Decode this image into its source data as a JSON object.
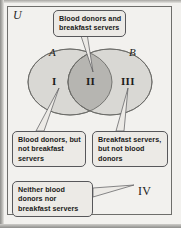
{
  "figure": {
    "universal_set_label": "U",
    "set_labels": {
      "left": "A",
      "right": "B"
    },
    "region_numerals": {
      "one": "I",
      "two": "II",
      "three": "III",
      "four": "IV"
    },
    "colors": {
      "page_background": "#f2f1ee",
      "circle_fill": "#d9d8d4",
      "intersection_fill": "#b6b5b1",
      "circle_stroke": "#6b6b68",
      "callout_fill": "#eceae6",
      "callout_stroke": "#57575a",
      "text": "#1b1b19"
    }
  },
  "callouts": {
    "intersection": {
      "name": "blood-donors-and-breakfast-servers",
      "lines": [
        "Blood donors and",
        "breakfast servers"
      ],
      "points_to": "II"
    },
    "left_only": {
      "name": "blood-donors-not-breakfast-servers",
      "lines": [
        "Blood donors, but",
        "not breakfast",
        "servers"
      ],
      "points_to": "I"
    },
    "right_only": {
      "name": "breakfast-servers-not-blood-donors",
      "lines": [
        "Breakfast servers,",
        "but not blood",
        "donors"
      ],
      "points_to": "III"
    },
    "outside": {
      "name": "neither-blood-donors-nor-breakfast-servers",
      "lines": [
        "Neither blood",
        "donors nor",
        "breakfast servers"
      ],
      "points_to": "IV"
    }
  }
}
